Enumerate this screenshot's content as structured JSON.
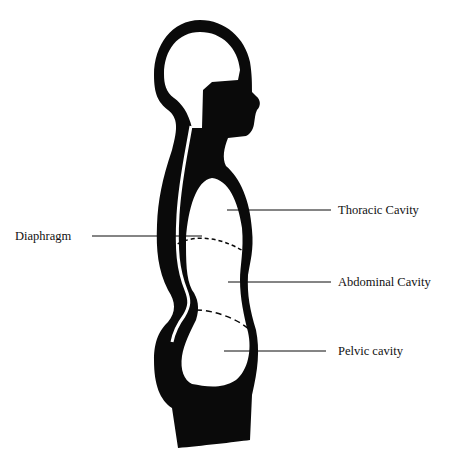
{
  "diagram": {
    "colors": {
      "ink": "#0a0a0a",
      "background": "#ffffff"
    },
    "labels": [
      {
        "id": "thoracic",
        "text": "Thoracic Cavity",
        "x": 338,
        "y": 206
      },
      {
        "id": "diaphragm",
        "text": "Diaphragm",
        "x": 15,
        "y": 230
      },
      {
        "id": "abdominal",
        "text": "Abdominal Cavity",
        "x": 338,
        "y": 277
      },
      {
        "id": "pelvic",
        "text": "Pelvic cavity",
        "x": 338,
        "y": 346
      }
    ]
  }
}
